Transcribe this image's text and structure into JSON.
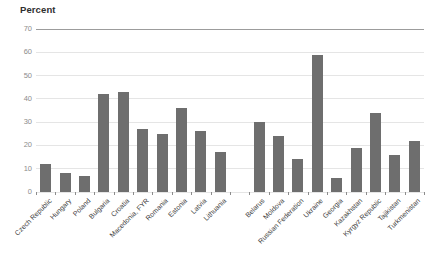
{
  "chart_data": {
    "type": "bar",
    "title": "Percent",
    "ylabel": "Percent",
    "xlabel": "",
    "ylim": [
      0,
      70
    ],
    "yticks": [
      0,
      10,
      20,
      30,
      40,
      50,
      60,
      70
    ],
    "grid": true,
    "legend": "none",
    "bar_color": "#6e6e6e",
    "categories": [
      "Czech Republic",
      "Hungary",
      "Poland",
      "Bulgaria",
      "Croatia",
      "Macedonia, FYR",
      "Romania",
      "Estonia",
      "Latvia",
      "Lithuania",
      "",
      "Belarus",
      "Moldova",
      "Russian Federation",
      "Ukraine",
      "Georgia",
      "Kazakhstan",
      "Kyrgyz Republic",
      "Tajikistan",
      "Turkmenistan"
    ],
    "values": [
      12,
      8,
      7,
      42,
      43,
      27,
      25,
      36,
      26,
      17,
      null,
      30,
      24,
      14,
      59,
      6,
      19,
      34,
      16,
      22
    ]
  },
  "colors": {
    "bar": "#6e6e6e",
    "grid_light": "#e5e5e5",
    "grid_top": "#9c9c9c",
    "y_label": "#8c8c8c",
    "x_label": "#404040",
    "title": "#2f2f2f"
  }
}
